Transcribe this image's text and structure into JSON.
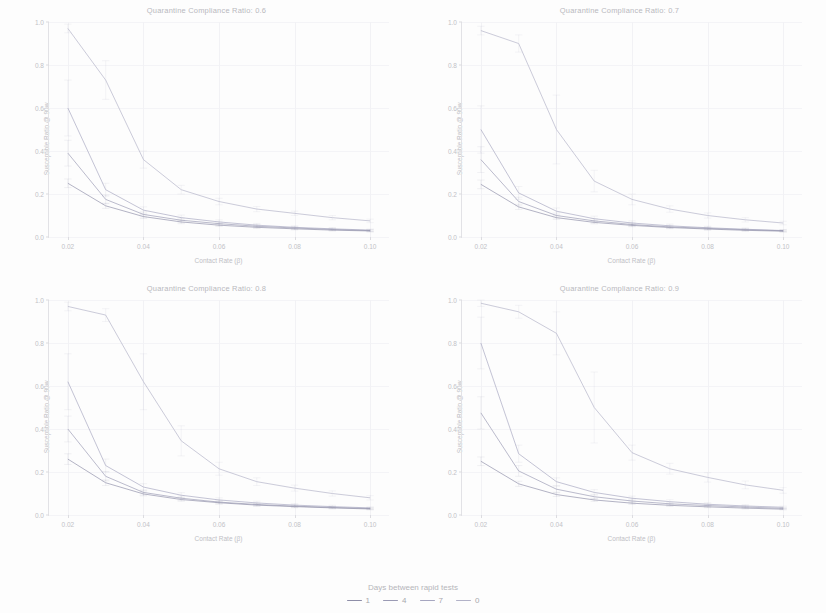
{
  "figure": {
    "xlabel": "Contact Rate (β)",
    "ylabel": "Susceptible Ratio @ 90w",
    "legend_title": "Days between rapid tests",
    "background": "#fdfdfd"
  },
  "legend": {
    "items": [
      {
        "label": "1",
        "color": "#8e8ea8"
      },
      {
        "label": "4",
        "color": "#9a9ab4"
      },
      {
        "label": "7",
        "color": "#a6a6c0"
      },
      {
        "label": "0",
        "color": "#b2b2c8"
      }
    ]
  },
  "axes": {
    "x_ticks": [
      "0.02",
      "0.04",
      "0.06",
      "0.08",
      "0.10"
    ],
    "x_values": [
      0.02,
      0.04,
      0.06,
      0.08,
      0.1
    ],
    "y_ticks": [
      "0.0",
      "0.2",
      "0.4",
      "0.6",
      "0.8",
      "1.0"
    ],
    "y_values": [
      0.0,
      0.2,
      0.4,
      0.6,
      0.8,
      1.0
    ],
    "xlim": [
      0.015,
      0.105
    ],
    "ylim": [
      0.0,
      1.0
    ]
  },
  "chart_data": {
    "type": "line",
    "xlabel": "Contact Rate (β)",
    "ylabel": "Susceptible Ratio @ 90w",
    "xlim": [
      0.015,
      0.105
    ],
    "ylim": [
      0.0,
      1.0
    ],
    "grid": true,
    "legend_position": "bottom-center",
    "legend_title": "Days between rapid tests",
    "error_bars": true,
    "x": [
      0.02,
      0.03,
      0.04,
      0.05,
      0.06,
      0.07,
      0.08,
      0.09,
      0.1
    ],
    "facets": [
      {
        "title": "Quarantine Compliance Ratio: 0.6",
        "compliance_ratio": 0.6,
        "series": [
          {
            "name": "0",
            "color": "#b2b2c8",
            "values": [
              0.97,
              0.73,
              0.36,
              0.22,
              0.165,
              0.13,
              0.11,
              0.09,
              0.075
            ],
            "err": [
              0.02,
              0.09,
              0.04,
              0.02,
              0.015,
              0.012,
              0.01,
              0.01,
              0.008
            ]
          },
          {
            "name": "7",
            "color": "#a6a6c0",
            "values": [
              0.6,
              0.22,
              0.125,
              0.09,
              0.07,
              0.055,
              0.045,
              0.038,
              0.032
            ],
            "err": [
              0.13,
              0.03,
              0.015,
              0.012,
              0.01,
              0.008,
              0.007,
              0.006,
              0.005
            ]
          },
          {
            "name": "4",
            "color": "#9a9ab4",
            "values": [
              0.39,
              0.175,
              0.105,
              0.078,
              0.062,
              0.05,
              0.042,
              0.035,
              0.03
            ],
            "err": [
              0.06,
              0.02,
              0.012,
              0.01,
              0.008,
              0.007,
              0.006,
              0.005,
              0.005
            ]
          },
          {
            "name": "1",
            "color": "#8e8ea8",
            "values": [
              0.25,
              0.145,
              0.095,
              0.07,
              0.055,
              0.045,
              0.038,
              0.032,
              0.028
            ],
            "err": [
              0.02,
              0.012,
              0.009,
              0.008,
              0.006,
              0.005,
              0.005,
              0.004,
              0.004
            ]
          }
        ]
      },
      {
        "title": "Quarantine Compliance Ratio: 0.7",
        "compliance_ratio": 0.7,
        "series": [
          {
            "name": "0",
            "color": "#b2b2c8",
            "values": [
              0.96,
              0.9,
              0.5,
              0.26,
              0.175,
              0.13,
              0.1,
              0.08,
              0.065
            ],
            "err": [
              0.02,
              0.04,
              0.16,
              0.05,
              0.025,
              0.015,
              0.012,
              0.01,
              0.008
            ]
          },
          {
            "name": "7",
            "color": "#a6a6c0",
            "values": [
              0.5,
              0.205,
              0.12,
              0.085,
              0.065,
              0.052,
              0.043,
              0.036,
              0.03
            ],
            "err": [
              0.11,
              0.03,
              0.015,
              0.012,
              0.01,
              0.008,
              0.007,
              0.006,
              0.005
            ]
          },
          {
            "name": "4",
            "color": "#9a9ab4",
            "values": [
              0.36,
              0.165,
              0.1,
              0.075,
              0.058,
              0.047,
              0.04,
              0.034,
              0.029
            ],
            "err": [
              0.06,
              0.02,
              0.012,
              0.01,
              0.008,
              0.007,
              0.006,
              0.005,
              0.004
            ]
          },
          {
            "name": "1",
            "color": "#8e8ea8",
            "values": [
              0.245,
              0.14,
              0.09,
              0.068,
              0.054,
              0.044,
              0.037,
              0.031,
              0.027
            ],
            "err": [
              0.02,
              0.012,
              0.009,
              0.007,
              0.006,
              0.005,
              0.005,
              0.004,
              0.004
            ]
          }
        ]
      },
      {
        "title": "Quarantine Compliance Ratio: 0.8",
        "compliance_ratio": 0.8,
        "series": [
          {
            "name": "0",
            "color": "#b2b2c8",
            "values": [
              0.97,
              0.93,
              0.62,
              0.345,
              0.215,
              0.155,
              0.125,
              0.1,
              0.08
            ],
            "err": [
              0.02,
              0.03,
              0.13,
              0.07,
              0.03,
              0.018,
              0.014,
              0.012,
              0.01
            ]
          },
          {
            "name": "7",
            "color": "#a6a6c0",
            "values": [
              0.62,
              0.23,
              0.13,
              0.092,
              0.07,
              0.056,
              0.046,
              0.039,
              0.033
            ],
            "err": [
              0.13,
              0.03,
              0.016,
              0.012,
              0.01,
              0.008,
              0.007,
              0.006,
              0.005
            ]
          },
          {
            "name": "4",
            "color": "#9a9ab4",
            "values": [
              0.4,
              0.18,
              0.105,
              0.078,
              0.06,
              0.049,
              0.041,
              0.035,
              0.03
            ],
            "err": [
              0.06,
              0.022,
              0.012,
              0.01,
              0.008,
              0.007,
              0.006,
              0.005,
              0.004
            ]
          },
          {
            "name": "1",
            "color": "#8e8ea8",
            "values": [
              0.26,
              0.15,
              0.098,
              0.072,
              0.057,
              0.046,
              0.039,
              0.033,
              0.028
            ],
            "err": [
              0.025,
              0.013,
              0.009,
              0.008,
              0.006,
              0.005,
              0.005,
              0.004,
              0.004
            ]
          }
        ]
      },
      {
        "title": "Quarantine Compliance Ratio: 0.9",
        "compliance_ratio": 0.9,
        "series": [
          {
            "name": "0",
            "color": "#b2b2c8",
            "values": [
              0.985,
              0.945,
              0.845,
              0.5,
              0.29,
              0.215,
              0.175,
              0.14,
              0.115
            ],
            "err": [
              0.015,
              0.03,
              0.1,
              0.165,
              0.035,
              0.025,
              0.022,
              0.018,
              0.014
            ]
          },
          {
            "name": "7",
            "color": "#a6a6c0",
            "values": [
              0.8,
              0.285,
              0.155,
              0.105,
              0.078,
              0.062,
              0.05,
              0.042,
              0.036
            ],
            "err": [
              0.12,
              0.04,
              0.018,
              0.013,
              0.01,
              0.009,
              0.007,
              0.006,
              0.005
            ]
          },
          {
            "name": "4",
            "color": "#9a9ab4",
            "values": [
              0.475,
              0.205,
              0.12,
              0.085,
              0.065,
              0.052,
              0.044,
              0.037,
              0.031
            ],
            "err": [
              0.075,
              0.025,
              0.014,
              0.011,
              0.009,
              0.007,
              0.006,
              0.005,
              0.004
            ]
          },
          {
            "name": "1",
            "color": "#8e8ea8",
            "values": [
              0.25,
              0.145,
              0.095,
              0.07,
              0.055,
              0.045,
              0.038,
              0.032,
              0.027
            ],
            "err": [
              0.02,
              0.012,
              0.009,
              0.007,
              0.006,
              0.005,
              0.004,
              0.004,
              0.003
            ]
          }
        ]
      }
    ]
  }
}
